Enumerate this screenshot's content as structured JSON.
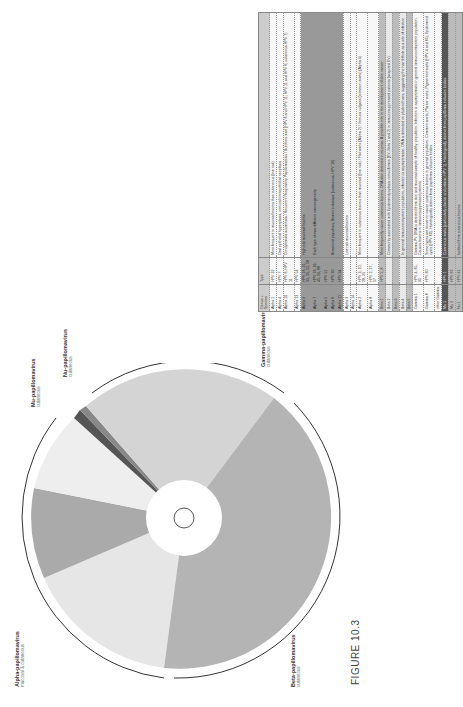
{
  "figure": {
    "label": "FIGURE 10.3"
  },
  "clades": [
    {
      "name": "Alpha-papillomavirus",
      "tropism": "mucosal & cutaneous"
    },
    {
      "name": "Beta-papillomavirus",
      "tropism": "cutaneous"
    },
    {
      "name": "Gamma-papillomavirus",
      "tropism": "cutaneous"
    },
    {
      "name": "Mu-papillomavirus",
      "tropism": "cutaneous"
    },
    {
      "name": "Nu-papillomavirus",
      "tropism": "cutaneous"
    }
  ],
  "table": {
    "headers": [
      "Genus + Species",
      "Type",
      ""
    ],
    "rows": [
      {
        "genus": "Alpha 1",
        "type": "HPV 32",
        "desc": "More frequent in mucosal lesions than cutaneous (low risk)",
        "shade": "wh"
      },
      {
        "genus": "Alpha 4",
        "type": "HPV 7",
        "desc": "Oral epithelial hyperplasia, cervical intraepithelial neoplasia",
        "shade": "wh"
      },
      {
        "genus": "Alpha 10",
        "type": "HPV 6, HPV 11",
        "desc": "Condylomata acuminata / Recurrent Respiratory Papillomatosis / Butchers wart (HPV 6 and HPV 11; HPV 11 and HPV 6; cutaneous HPV 7)",
        "shade": "wh"
      },
      {
        "genus": "Alpha 13",
        "type": "HPV 54",
        "desc": "",
        "shade": "wh"
      },
      {
        "genus": "Alpha 9",
        "type": "HPV 16, 31, 33, 35, 52, 58",
        "desc": "High risk mucosal lesions",
        "shade": "dk"
      },
      {
        "genus": "Alpha 7",
        "type": "HPV 18, 39, 45, 59, 68",
        "desc": "Each type shows different carcinogenicity",
        "shade": "dk"
      },
      {
        "genus": "Alpha 5",
        "type": "HPV 51",
        "desc": "",
        "shade": "dk"
      },
      {
        "genus": "Alpha 6",
        "type": "HPV 30",
        "desc": "Bowenoid papulosis, Bowen's disease (cutaneous, HPV 16)",
        "shade": "dk"
      },
      {
        "genus": "Alpha 11",
        "type": "HPV 34",
        "desc": "",
        "shade": "dk"
      },
      {
        "genus": "Alpha 3",
        "type": "",
        "desc": "Low risk mucosal lesions",
        "shade": "wh"
      },
      {
        "genus": "Alpha 14",
        "type": "",
        "desc": "",
        "shade": "wh"
      },
      {
        "genus": "Alpha 2",
        "type": "HPV 3, 10, 28, 29",
        "desc": "More frequent in cutaneous lesions than mucosal (low risk) / Flat warts (Alpha 2) / Verruca vulgaris (common warts) (Alpha 4)",
        "shade": "wh"
      },
      {
        "genus": "Alpha 8",
        "type": "HPV 2, 27, 57",
        "desc": "",
        "shade": "wh"
      },
      {
        "genus": "Beta 1",
        "type": "HPV 5, 8",
        "desc": "Most frequently cause cutaneous lesions. DNA also detected in mucosa. A possible role in the development of skin cancer",
        "shade": "md"
      },
      {
        "genus": "Beta 2",
        "type": "",
        "desc": "Commonly associated with Epidermodysplasia verruciformis (EV; Beta 1 and 2) in immunosuppressed patients (acquired EV)",
        "shade": "lt"
      },
      {
        "genus": "Beta 3",
        "type": "",
        "desc": "",
        "shade": "md"
      },
      {
        "genus": "Beta 4",
        "type": "",
        "desc": "In general immunocompetent population, infection is asymptomatic. DNA is detected on plucked hairs, suggesting the hair follicle as a site of infection",
        "shade": "lt"
      },
      {
        "genus": "Beta 5",
        "type": "",
        "desc": "",
        "shade": "md"
      },
      {
        "genus": "Gamma 1",
        "type": "HPV 4, 65, 95",
        "desc": "Gamma-PV DNA is detected from skin and mucosal sample of healthy population. Infection is asymptomatic in general immunocompetent population. Causes lesions in immunosuppressed patients",
        "shade": "wh"
      },
      {
        "genus": "Gamma 6",
        "type": "HPV 60",
        "desc": "Some types are known to cause cutaneous lesions in general population. Common warts, Plantar warts, Pigmented warts (HPV 4 and 65), Epidermoid cysts (HPV 60). Histologically distinct from papilloma inclusion bodies",
        "shade": "wh"
      },
      {
        "genus": "other Gamma",
        "type": "",
        "desc": "",
        "shade": "wh"
      },
      {
        "genus": "Mu 1",
        "type": "HPV 1",
        "desc": "Cutaneous warts (particularly plantar and palmar; HPV 1). Histologically distinct from papilloma inclusion bodies",
        "shade": "vdk"
      },
      {
        "genus": "Mu 2",
        "type": "HPV 63",
        "desc": "",
        "shade": "md"
      },
      {
        "genus": "Nu 1",
        "type": "HPV 41",
        "desc": "Isolated from cutaneous lesions",
        "shade": "md"
      }
    ]
  }
}
